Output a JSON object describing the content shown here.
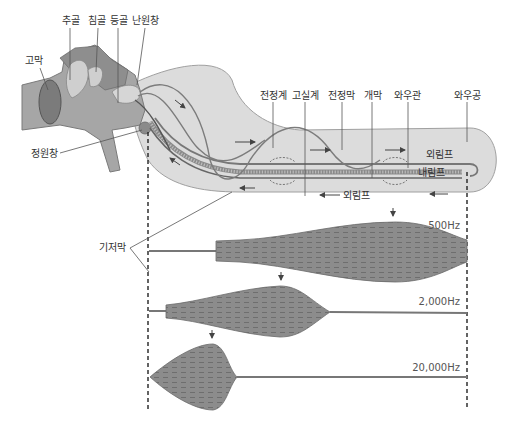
{
  "diagram": {
    "title": "",
    "colors": {
      "canal_fill": "#d9d9d9",
      "canal_stroke": "#9a9a9a",
      "bone_fill": "#a9a9a9",
      "bone_dark": "#8a8a8a",
      "ossicle_fill": "#d0d0d0",
      "eardrum_fill": "#7d7d7d",
      "membrane_fill": "#8c8c8c",
      "membrane_stroke": "#6a6a6a",
      "text": "#333333",
      "guide_line": "#222222"
    },
    "ear_labels": {
      "malleus": "추골",
      "incus": "침골",
      "stapes": "등골",
      "oval_window": "난원창",
      "eardrum": "고막",
      "round_window": "정원창"
    },
    "cochlea_labels": {
      "scala_vestibuli": "전정계",
      "scala_tympani": "고실계",
      "reissner_membrane": "전정막",
      "tectorial_membrane": "개막",
      "cochlear_duct": "와우관",
      "helicotrema": "와우공",
      "perilymph_upper": "외림프",
      "endolymph": "내림프",
      "perilymph_lower": "외림프",
      "basilar_membrane": "기저막"
    },
    "frequency_panels": [
      {
        "label": "500Hz",
        "peak_position": "apex"
      },
      {
        "label": "2,000Hz",
        "peak_position": "middle"
      },
      {
        "label": "20,000Hz",
        "peak_position": "base"
      }
    ]
  }
}
